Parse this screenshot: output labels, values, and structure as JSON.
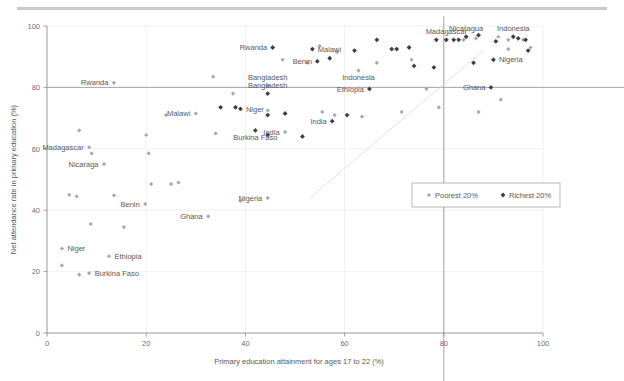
{
  "figure": {
    "background_color": "#ffffff",
    "rule_color": "#c9c9cb"
  },
  "chart_data": {
    "type": "scatter",
    "title": "",
    "xlabel": "Primary education attainment for ages 17 to 22 (%)",
    "ylabel": "Net attendance rate in primary education (%)",
    "xlim": [
      0,
      100
    ],
    "ylim": [
      0,
      100
    ],
    "xticks": [
      0,
      20,
      40,
      60,
      80,
      100
    ],
    "yticks": [
      0,
      20,
      40,
      60,
      80,
      100
    ],
    "grid": true,
    "legend_position": "center-right-inside",
    "reference_lines": {
      "horizontal_y": 80,
      "vertical_x": 80,
      "diagonal": {
        "from": [
          53,
          44
        ],
        "to": [
          88,
          92
        ]
      }
    },
    "series": [
      {
        "name": "Poorest 20%",
        "marker": "diamond",
        "color": "#a7a7aa",
        "points": [
          {
            "label": "Rwanda",
            "x": 13.5,
            "y": 81.5,
            "label_pos": "left"
          },
          {
            "label": "Malawi",
            "x": 30.0,
            "y": 71.5,
            "label_pos": "left"
          },
          {
            "label": "Madagascar",
            "x": 8.5,
            "y": 60.5,
            "label_pos": "left"
          },
          {
            "label": "Nicaraga",
            "x": 11.5,
            "y": 55.0,
            "label_pos": "left"
          },
          {
            "label": "Benin",
            "x": 19.8,
            "y": 42.0,
            "label_pos": "left"
          },
          {
            "label": "Ghana",
            "x": 32.5,
            "y": 38.0,
            "label_pos": "left"
          },
          {
            "label": "Nigeria",
            "x": 44.5,
            "y": 44.0,
            "label_pos": "left"
          },
          {
            "label": "Niger",
            "x": 3.0,
            "y": 27.5,
            "label_pos": "right"
          },
          {
            "label": "Ethiopia",
            "x": 12.5,
            "y": 25.0,
            "label_pos": "right"
          },
          {
            "label": "Burkina Faso",
            "x": 8.5,
            "y": 19.5,
            "label_pos": "right"
          },
          {
            "label": "Bangladesh",
            "x": 44.5,
            "y": 80.5,
            "label_pos": "above"
          },
          {
            "label": "India",
            "x": 48.0,
            "y": 65.5,
            "label_pos": "left"
          },
          {
            "label": "Indonesia",
            "x": 62.8,
            "y": 85.5,
            "label_pos": "below"
          },
          {
            "label": "",
            "x": 6.5,
            "y": 66.0
          },
          {
            "label": "",
            "x": 9.0,
            "y": 58.5
          },
          {
            "label": "",
            "x": 13.5,
            "y": 44.8
          },
          {
            "label": "",
            "x": 20.0,
            "y": 64.5
          },
          {
            "label": "",
            "x": 20.5,
            "y": 58.5
          },
          {
            "label": "",
            "x": 21.0,
            "y": 48.5
          },
          {
            "label": "",
            "x": 24.0,
            "y": 71.0
          },
          {
            "label": "",
            "x": 26.5,
            "y": 49.0
          },
          {
            "label": "",
            "x": 33.5,
            "y": 83.5
          },
          {
            "label": "",
            "x": 34.0,
            "y": 65.0
          },
          {
            "label": "",
            "x": 37.5,
            "y": 78.0
          },
          {
            "label": "",
            "x": 39.0,
            "y": 43.0
          },
          {
            "label": "",
            "x": 4.5,
            "y": 45.0
          },
          {
            "label": "",
            "x": 6.0,
            "y": 44.5
          },
          {
            "label": "",
            "x": 8.8,
            "y": 35.5
          },
          {
            "label": "",
            "x": 3.0,
            "y": 22.0
          },
          {
            "label": "",
            "x": 6.5,
            "y": 19.0
          },
          {
            "label": "",
            "x": 15.5,
            "y": 34.5
          },
          {
            "label": "",
            "x": 25.0,
            "y": 48.5
          },
          {
            "label": "",
            "x": 44.5,
            "y": 72.5
          },
          {
            "label": "",
            "x": 47.5,
            "y": 89.0
          },
          {
            "label": "",
            "x": 52.5,
            "y": 88.0
          },
          {
            "label": "",
            "x": 55.0,
            "y": 93.5
          },
          {
            "label": "",
            "x": 55.5,
            "y": 72.0
          },
          {
            "label": "",
            "x": 58.0,
            "y": 71.0
          },
          {
            "label": "",
            "x": 58.5,
            "y": 91.5
          },
          {
            "label": "",
            "x": 63.5,
            "y": 70.5
          },
          {
            "label": "",
            "x": 66.5,
            "y": 88.0
          },
          {
            "label": "",
            "x": 71.5,
            "y": 72.0
          },
          {
            "label": "",
            "x": 73.5,
            "y": 89.0
          },
          {
            "label": "",
            "x": 76.5,
            "y": 79.5
          },
          {
            "label": "",
            "x": 79.0,
            "y": 73.5
          },
          {
            "label": "",
            "x": 80.5,
            "y": 95.5
          },
          {
            "label": "",
            "x": 84.0,
            "y": 95.5
          },
          {
            "label": "",
            "x": 86.5,
            "y": 96.0
          },
          {
            "label": "",
            "x": 87.0,
            "y": 72.0
          },
          {
            "label": "",
            "x": 91.0,
            "y": 96.5
          },
          {
            "label": "",
            "x": 93.0,
            "y": 95.5
          },
          {
            "label": "",
            "x": 93.0,
            "y": 92.5
          },
          {
            "label": "",
            "x": 96.0,
            "y": 95.5
          },
          {
            "label": "",
            "x": 97.5,
            "y": 93.0
          },
          {
            "label": "",
            "x": 91.5,
            "y": 76.0
          }
        ]
      },
      {
        "name": "Richest 20%",
        "marker": "diamond",
        "color": "#3f3f42",
        "points": [
          {
            "label": "Rwanda",
            "x": 45.5,
            "y": 93.0,
            "label_pos": "left"
          },
          {
            "label": "Bangladesh",
            "x": 44.5,
            "y": 78.0,
            "label_pos": "above"
          },
          {
            "label": "India",
            "x": 57.5,
            "y": 69.0,
            "label_pos": "left"
          },
          {
            "label": "Niger",
            "x": 39.0,
            "y": 73.0,
            "label_pos": "right"
          },
          {
            "label": "Burkina Faso",
            "x": 42.0,
            "y": 66.0,
            "label_pos": "below"
          },
          {
            "label": "Malawi",
            "x": 53.5,
            "y": 92.5,
            "label_pos": "right"
          },
          {
            "label": "Benin",
            "x": 54.5,
            "y": 88.5,
            "label_pos": "left"
          },
          {
            "label": "Ethiopia",
            "x": 65.0,
            "y": 79.5,
            "label_pos": "left"
          },
          {
            "label": "Indonesia",
            "x": 94.0,
            "y": 96.5,
            "label_pos": "above"
          },
          {
            "label": "Madagascar",
            "x": 80.5,
            "y": 95.5,
            "label_pos": "above"
          },
          {
            "label": "Nicaragua",
            "x": 84.5,
            "y": 96.5,
            "label_pos": "above"
          },
          {
            "label": "Nigeria",
            "x": 90.0,
            "y": 89.0,
            "label_pos": "right"
          },
          {
            "label": "Ghana",
            "x": 89.5,
            "y": 80.0,
            "label_pos": "left"
          },
          {
            "label": "",
            "x": 35.0,
            "y": 73.5
          },
          {
            "label": "",
            "x": 38.0,
            "y": 73.5
          },
          {
            "label": "",
            "x": 44.5,
            "y": 71.0
          },
          {
            "label": "",
            "x": 48.0,
            "y": 71.5
          },
          {
            "label": "",
            "x": 44.5,
            "y": 64.5
          },
          {
            "label": "",
            "x": 51.5,
            "y": 64.0
          },
          {
            "label": "",
            "x": 60.5,
            "y": 71.0
          },
          {
            "label": "",
            "x": 62.0,
            "y": 92.0
          },
          {
            "label": "",
            "x": 66.5,
            "y": 95.5
          },
          {
            "label": "",
            "x": 69.5,
            "y": 92.5
          },
          {
            "label": "",
            "x": 70.5,
            "y": 92.5
          },
          {
            "label": "",
            "x": 73.0,
            "y": 93.0
          },
          {
            "label": "",
            "x": 74.0,
            "y": 87.0
          },
          {
            "label": "",
            "x": 78.5,
            "y": 95.5
          },
          {
            "label": "",
            "x": 78.0,
            "y": 86.5
          },
          {
            "label": "",
            "x": 82.0,
            "y": 95.5
          },
          {
            "label": "",
            "x": 83.0,
            "y": 95.5
          },
          {
            "label": "",
            "x": 87.0,
            "y": 97.0
          },
          {
            "label": "",
            "x": 90.5,
            "y": 95.0
          },
          {
            "label": "",
            "x": 95.0,
            "y": 96.0
          },
          {
            "label": "",
            "x": 96.5,
            "y": 95.5
          },
          {
            "label": "",
            "x": 97.0,
            "y": 92.0
          },
          {
            "label": "",
            "x": 86.0,
            "y": 88.0
          },
          {
            "label": "",
            "x": 57.0,
            "y": 89.5
          }
        ]
      }
    ]
  },
  "legend": {
    "items": [
      {
        "label": "Poorest 20%",
        "color": "#a7a7aa"
      },
      {
        "label": "Richest 20%",
        "color": "#3f3f42"
      }
    ]
  },
  "axes": {
    "x_tick_labels": [
      "0",
      "20",
      "40",
      "60",
      "80",
      "100"
    ],
    "y_tick_labels": [
      "0",
      "20",
      "40",
      "60",
      "80",
      "100"
    ],
    "x_title": "Primary education attainment for ages 17 to 22 (%)",
    "y_title": "Net attendance rate in primary education (%)"
  }
}
